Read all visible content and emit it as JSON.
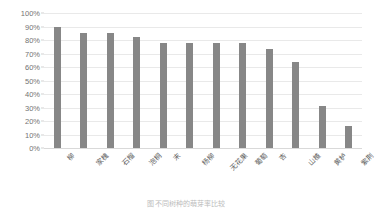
{
  "chart_data": {
    "type": "bar",
    "title": "",
    "xlabel": "",
    "ylabel": "",
    "ylim": [
      0,
      100
    ],
    "grid": true,
    "legend": false,
    "unit": "%",
    "bar_color": "#878787",
    "gridline_color": "#e9e9e9",
    "axis_text_color": "#6b6b6b",
    "categories": [
      "柳",
      "家槐",
      "石榴",
      "泡桐",
      "末",
      "杨柳",
      "无花果",
      "葡萄",
      "杏",
      "山楂",
      "黄栌",
      "紫荆"
    ],
    "values": [
      90,
      85,
      85,
      82,
      78,
      78,
      78,
      78,
      73,
      64,
      31,
      16
    ],
    "yticks": [
      "0%",
      "10%",
      "20%",
      "30%",
      "40%",
      "50%",
      "60%",
      "70%",
      "80%",
      "90%",
      "100%"
    ],
    "ytick_values": [
      0,
      10,
      20,
      30,
      40,
      50,
      60,
      70,
      80,
      90,
      100
    ]
  },
  "caption": {
    "text": "图  不同树种的萌芽率比较"
  }
}
